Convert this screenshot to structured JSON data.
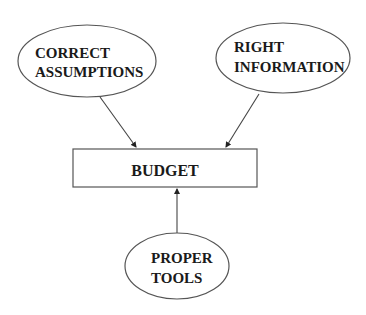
{
  "diagram": {
    "type": "flow",
    "nodes": {
      "correct_assumptions": {
        "line1": "CORRECT",
        "line2": "ASSUMPTIONS",
        "shape": "ellipse"
      },
      "right_information": {
        "line1": "RIGHT",
        "line2": "INFORMATION",
        "shape": "ellipse"
      },
      "budget": {
        "label": "BUDGET",
        "shape": "rectangle"
      },
      "proper_tools": {
        "line1": "PROPER",
        "line2": "TOOLS",
        "shape": "ellipse"
      }
    },
    "edges": [
      {
        "from": "CORRECT ASSUMPTIONS",
        "to": "BUDGET"
      },
      {
        "from": "RIGHT INFORMATION",
        "to": "BUDGET"
      },
      {
        "from": "PROPER TOOLS",
        "to": "BUDGET"
      }
    ],
    "colors": {
      "stroke": "#555555",
      "text": "#1a1a1a",
      "background": "#ffffff"
    }
  }
}
